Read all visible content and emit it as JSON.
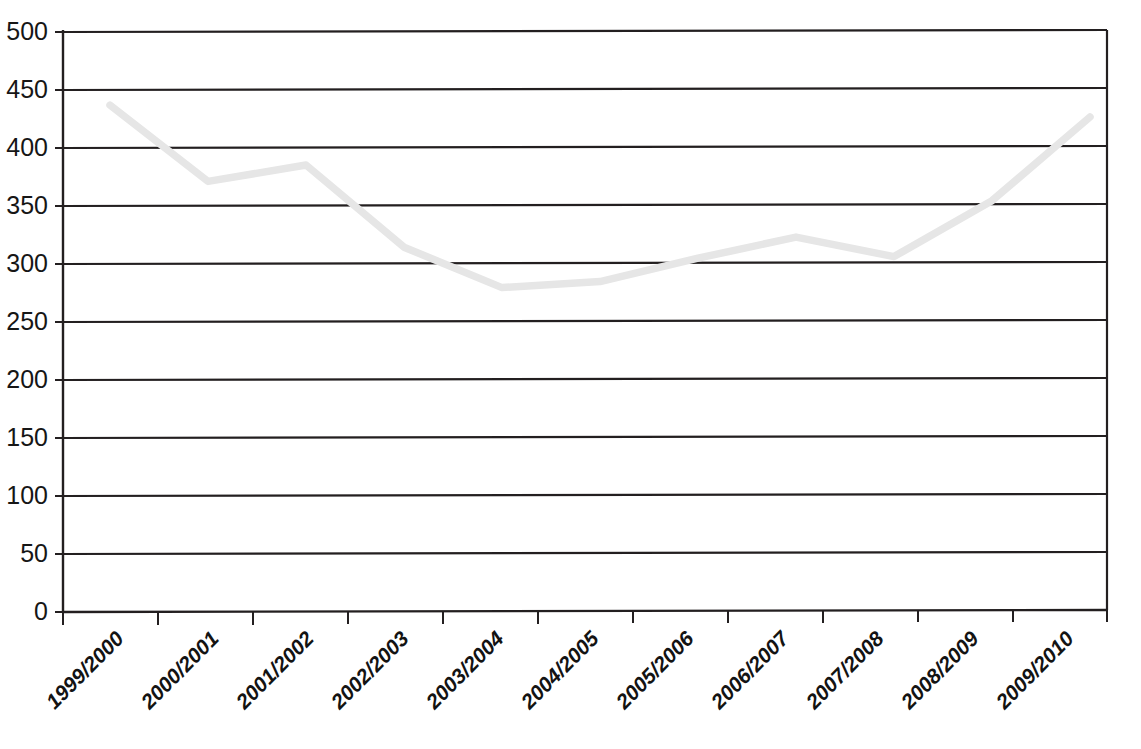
{
  "chart_data": {
    "type": "line",
    "title": "",
    "subtitle": "",
    "xlabel": "",
    "ylabel": "",
    "categories": [
      "1999/2000",
      "2000/2001",
      "2001/2002",
      "2002/2003",
      "2003/2004",
      "2004/2005",
      "2005/2006",
      "2006/2007",
      "2007/2008",
      "2008/2009",
      "2009/2010"
    ],
    "values": [
      437,
      371,
      385,
      314,
      279,
      284,
      304,
      322,
      305,
      353,
      425
    ],
    "series": [
      {
        "name": "",
        "values": [
          437,
          371,
          385,
          314,
          279,
          284,
          304,
          322,
          305,
          353,
          425
        ],
        "color": "#e6e6e6"
      }
    ],
    "ylim": [
      0,
      500
    ],
    "ytick_values": [
      0,
      50,
      100,
      150,
      200,
      250,
      300,
      350,
      400,
      450,
      500
    ],
    "ytick_labels": [
      "0",
      "50",
      "100",
      "150",
      "200",
      "250",
      "300",
      "350",
      "400",
      "450",
      "500"
    ],
    "grid": true,
    "grid_axis": "y",
    "legend": false,
    "legend_position": "none",
    "annotations": [],
    "colors": {
      "line": "#e6e6e6",
      "grid": "#231f20",
      "axis": "#231f20",
      "text": "#161616",
      "background": "#ffffff"
    }
  },
  "axes": {
    "x_label_rotation_degrees": -45
  }
}
